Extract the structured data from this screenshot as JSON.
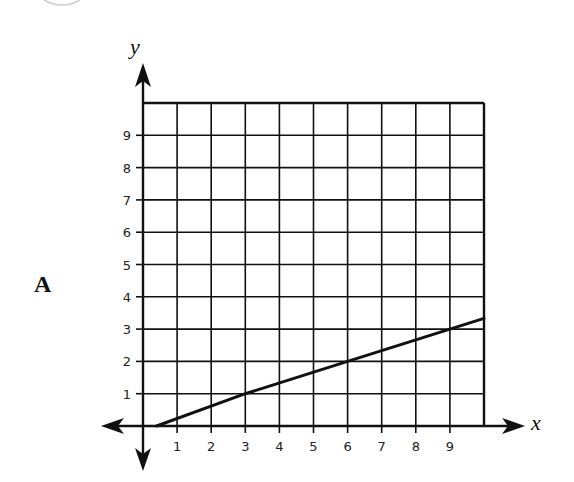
{
  "option_label": "A",
  "chart_data": {
    "type": "line",
    "title": "",
    "xlabel": "x",
    "ylabel": "y",
    "xlim": [
      0,
      10
    ],
    "ylim": [
      0,
      10
    ],
    "grid": true,
    "x_ticks": [
      "1",
      "2",
      "3",
      "4",
      "5",
      "6",
      "7",
      "8",
      "9"
    ],
    "y_ticks": [
      "1",
      "2",
      "3",
      "4",
      "5",
      "6",
      "7",
      "8",
      "9"
    ],
    "series": [
      {
        "name": "line",
        "equation": "y = x/3",
        "x": [
          0.4,
          3,
          6,
          9,
          10
        ],
        "y": [
          0,
          1,
          2,
          3,
          3.33
        ]
      }
    ],
    "legend": null
  },
  "colors": {
    "ink": "#111111",
    "background": "#ffffff"
  }
}
